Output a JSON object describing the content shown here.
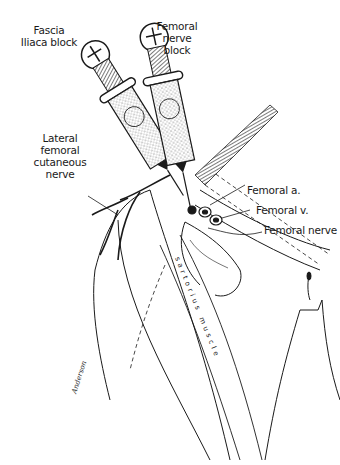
{
  "figure": {
    "labels": {
      "fascia_iliaca": [
        "Fascia",
        "Iliaca block"
      ],
      "femoral_nerve_block": [
        "Femoral",
        "nerve",
        "block"
      ],
      "lateral_femoral_cutaneous": [
        "Lateral",
        "femoral",
        "cutaneous",
        "nerve"
      ],
      "femoral_artery": "Femoral a.",
      "femoral_vein": "Femoral v.",
      "femoral_nerve": "Femoral nerve",
      "sartorius": "s a r t o r i u s   m u s c l e"
    },
    "signature": "Anderson"
  },
  "colors": {
    "ink": "#1a1a1a",
    "background": "#ffffff",
    "stipple": "#555555"
  }
}
